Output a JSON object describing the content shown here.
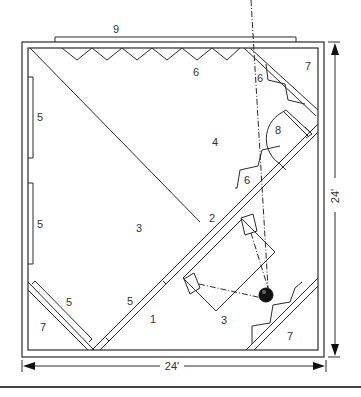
{
  "diagram": {
    "colors": {
      "line": "#2a2a2a",
      "text": "#333333",
      "background": "#ffffff"
    },
    "dimensions": {
      "width_label": "24'",
      "height_label": "24'"
    },
    "labels": {
      "l1": "1",
      "l2": "2",
      "l3a": "3",
      "l3b": "3",
      "l4": "4",
      "l5a": "5",
      "l5b": "5",
      "l5c": "5",
      "l5d": "5",
      "l6a": "6",
      "l6b": "6",
      "l6c": "6",
      "l7a": "7",
      "l7b": "7",
      "l7c": "7",
      "l8": "8",
      "l9": "9"
    }
  }
}
